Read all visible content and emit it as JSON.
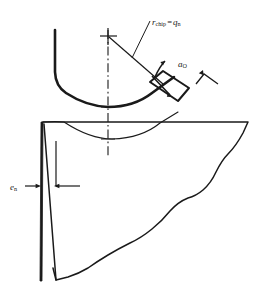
{
  "figure": {
    "stroke_color": "#1a1a1a",
    "background_color": "#ffffff"
  },
  "labels": {
    "chip_radius": {
      "name": "r_chip = q_n",
      "var1": "r",
      "sub1": "chip",
      "equals": "=",
      "var2": "q",
      "sub2": "n"
    },
    "chip_thickness": {
      "name": "a_O",
      "var": "a",
      "sub": "O"
    },
    "edge_dimension": {
      "name": "e_n",
      "var": "e",
      "sub": "n"
    }
  },
  "elements": {
    "center_mark": "center-cross",
    "centerline": "dash-dot vertical centerline",
    "chip_outer_arc": "curled chip outer boundary",
    "chip_inner_arc": "curled chip inner boundary",
    "thickness_parallelogram": "chip thickness indicator quadrilateral",
    "tool_body": "cutting tool body with irregular fracture edge",
    "sliver": "thin wedge sliver at tool nose",
    "radius_leader": "leader line from center to chip surface"
  }
}
